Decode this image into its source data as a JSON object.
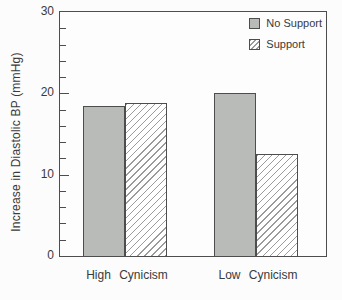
{
  "chart_data": {
    "type": "bar",
    "title": "",
    "categories": [
      "High Cynicism",
      "Low Cynicism"
    ],
    "series": [
      {
        "name": "No Support",
        "style": "solid-gray",
        "values": [
          18.5,
          20.1
        ]
      },
      {
        "name": "Support",
        "style": "diagonal-hatch",
        "values": [
          18.8,
          12.5
        ]
      }
    ],
    "xlabel": "",
    "ylabel": "Increase in Diastolic BP (mmHg)",
    "ylim": [
      0,
      30
    ],
    "yticks": [
      0,
      10,
      20,
      30
    ],
    "y_minor_tick_step": 2,
    "grid": false,
    "legend_position": "top-right-inside"
  },
  "colors": {
    "background": "#fcfcfc",
    "bar_fill": "#b9bbb9",
    "hatch_line": "#9b9b9b",
    "axis": "#4d4d4d",
    "text": "#3a3a3a"
  }
}
